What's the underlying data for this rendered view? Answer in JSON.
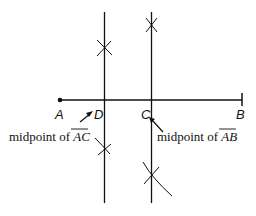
{
  "diagram": {
    "points": {
      "A": {
        "label": "A"
      },
      "B": {
        "label": "B"
      },
      "C": {
        "label": "C"
      },
      "D": {
        "label": "D"
      }
    },
    "annotations": {
      "midpoint_ac": {
        "prefix": "midpoint of ",
        "segment": "AC"
      },
      "midpoint_ab": {
        "prefix": "midpoint of ",
        "segment": "AB"
      }
    },
    "colors": {
      "stroke": "#111111",
      "background": "#ffffff"
    }
  }
}
